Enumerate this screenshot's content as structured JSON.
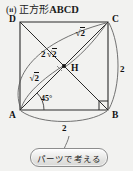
{
  "page": {
    "background_color": "#f2f2f0",
    "ink_color": "#1a1a1a"
  },
  "header": {
    "paren_open": "(",
    "item_number": "ii",
    "paren_close": ")",
    "shape_word": "正方形",
    "shape_name": "ABCD",
    "full_title": "( ii ) 正方形 ABCD"
  },
  "figure": {
    "type": "geometry-diagram",
    "shape": "square",
    "vertices": [
      {
        "name": "D",
        "label": "D",
        "position": "top-left"
      },
      {
        "name": "C",
        "label": "C",
        "position": "top-right"
      },
      {
        "name": "A",
        "label": "A",
        "position": "bottom-left"
      },
      {
        "name": "B",
        "label": "B",
        "position": "bottom-right"
      }
    ],
    "interior_point": {
      "name": "H",
      "label": "H",
      "description": "intersection of diagonals"
    },
    "angle_marks": [
      {
        "at": "A",
        "label": "45°",
        "type": "arc"
      },
      {
        "at": "B",
        "label": "",
        "type": "right-angle-square"
      }
    ],
    "measurements": [
      {
        "id": "diag-ac",
        "label_parts": {
          "coefficient": "2",
          "radical": "2"
        },
        "label": "2√2",
        "side": "diagonal A–C"
      },
      {
        "id": "hc",
        "label_parts": {
          "coefficient": "",
          "radical": "2"
        },
        "label": "√2",
        "side": "H–C"
      },
      {
        "id": "ah",
        "label_parts": {
          "coefficient": "",
          "radical": "2"
        },
        "label": "√2",
        "side": "A–H"
      },
      {
        "id": "bc",
        "label": "2",
        "side": "right side B–C"
      },
      {
        "id": "ab",
        "label": "2",
        "side": "bottom side A–B"
      }
    ]
  },
  "button": {
    "label": "パーツで考える",
    "name": "think-in-parts-button"
  }
}
